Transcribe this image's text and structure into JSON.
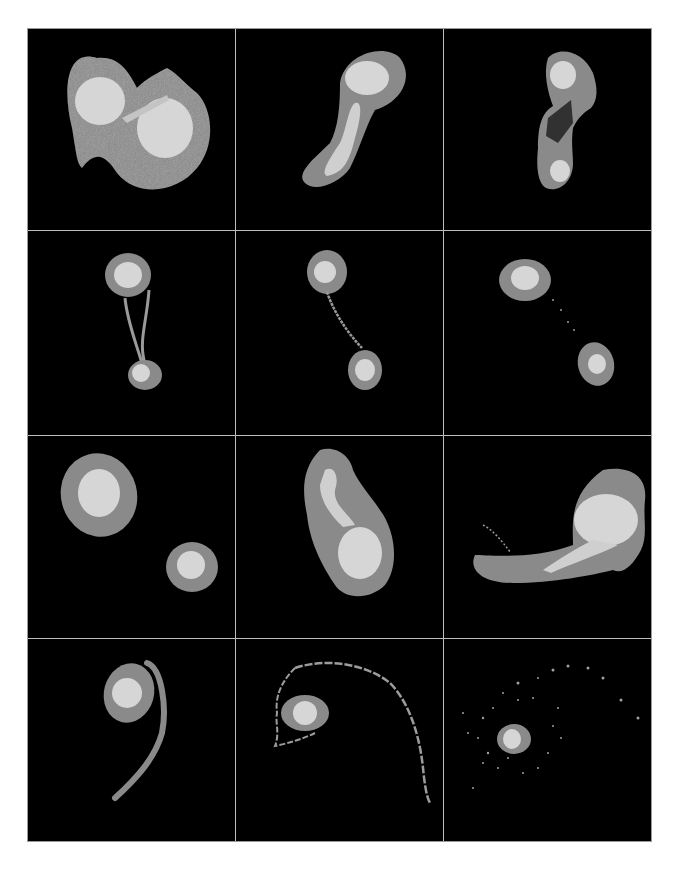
{
  "figure": {
    "layout": {
      "rows": 4,
      "columns": 3
    },
    "colors": {
      "background": "#000000",
      "envelope": "#8a8a8a",
      "core": "#d8d8d8",
      "debris": "#9c9c9c",
      "divider": "#bdbdbd",
      "page": "#ffffff"
    },
    "panels": [
      {
        "index": 1,
        "label": "snapshot-1",
        "state": "overlapping pair, S-shaped envelope"
      },
      {
        "index": 2,
        "label": "snapshot-2",
        "state": "elongated tidal arm"
      },
      {
        "index": 3,
        "label": "snapshot-3",
        "state": "stretched bridge with voids"
      },
      {
        "index": 4,
        "label": "snapshot-4",
        "state": "two cores connected by thin bridge"
      },
      {
        "index": 5,
        "label": "snapshot-5",
        "state": "separating cores with bridge"
      },
      {
        "index": 6,
        "label": "snapshot-6",
        "state": "separated cores, faint debris"
      },
      {
        "index": 7,
        "label": "snapshot-7",
        "state": "two detached systems"
      },
      {
        "index": 8,
        "label": "snapshot-8",
        "state": "second close encounter"
      },
      {
        "index": 9,
        "label": "snapshot-9",
        "state": "merger with long tidal tail"
      },
      {
        "index": 10,
        "label": "snapshot-10",
        "state": "remnant with curved tail"
      },
      {
        "index": 11,
        "label": "snapshot-11",
        "state": "remnant with arcing shell"
      },
      {
        "index": 12,
        "label": "snapshot-12",
        "state": "compact remnant with scattered debris"
      }
    ]
  }
}
